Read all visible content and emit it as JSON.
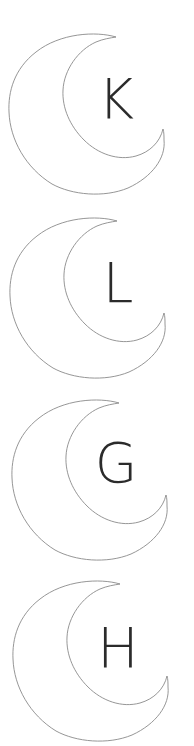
{
  "page": {
    "background": "#ffffff"
  },
  "style": {
    "outline_color": "#8a8a8a",
    "letter_color": "#2b2b2b"
  },
  "moons": [
    {
      "letter": "K",
      "icon": "crescent-moon-icon",
      "offset_x": 0,
      "offset_y": 0
    },
    {
      "letter": "L",
      "icon": "crescent-moon-icon",
      "offset_x": 1,
      "offset_y": 184
    },
    {
      "letter": "G",
      "icon": "crescent-moon-icon",
      "offset_x": 3,
      "offset_y": 366
    },
    {
      "letter": "H",
      "icon": "crescent-moon-icon",
      "offset_x": 4,
      "offset_y": 547
    }
  ]
}
